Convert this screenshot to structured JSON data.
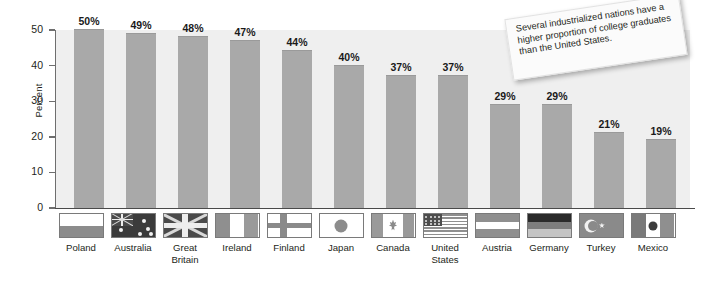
{
  "chart_data": {
    "type": "bar",
    "title": "",
    "xlabel": "",
    "ylabel": "Percent",
    "ylim": [
      0,
      50
    ],
    "yticks": [
      0,
      10,
      20,
      30,
      40,
      50
    ],
    "grid": false,
    "legend": "none",
    "value_suffix": "%",
    "categories": [
      "Poland",
      "Australia",
      "Great Britain",
      "Ireland",
      "Finland",
      "Japan",
      "Canada",
      "United States",
      "Austria",
      "Germany",
      "Turkey",
      "Mexico"
    ],
    "values": [
      50,
      49,
      48,
      47,
      44,
      40,
      37,
      37,
      29,
      29,
      21,
      19
    ],
    "value_labels": [
      "50%",
      "49%",
      "48%",
      "47%",
      "44%",
      "40%",
      "37%",
      "37%",
      "29%",
      "29%",
      "21%",
      "19%"
    ],
    "annotations": [
      "Several industrialized nations have a higher proportion of college graduates than the United States."
    ]
  },
  "axis": {
    "y_title": "Percent",
    "y_tick_labels": [
      "50",
      "40",
      "30",
      "20",
      "10",
      "0"
    ]
  },
  "flags": [
    {
      "country": "Poland",
      "label_lines": [
        "Poland"
      ],
      "icon": "flag-poland"
    },
    {
      "country": "Australia",
      "label_lines": [
        "Australia"
      ],
      "icon": "flag-australia"
    },
    {
      "country": "Great Britain",
      "label_lines": [
        "Great",
        "Britain"
      ],
      "icon": "flag-great-britain"
    },
    {
      "country": "Ireland",
      "label_lines": [
        "Ireland"
      ],
      "icon": "flag-ireland"
    },
    {
      "country": "Finland",
      "label_lines": [
        "Finland"
      ],
      "icon": "flag-finland"
    },
    {
      "country": "Japan",
      "label_lines": [
        "Japan"
      ],
      "icon": "flag-japan"
    },
    {
      "country": "Canada",
      "label_lines": [
        "Canada"
      ],
      "icon": "flag-canada"
    },
    {
      "country": "United States",
      "label_lines": [
        "United",
        "States"
      ],
      "icon": "flag-united-states"
    },
    {
      "country": "Austria",
      "label_lines": [
        "Austria"
      ],
      "icon": "flag-austria"
    },
    {
      "country": "Germany",
      "label_lines": [
        "Germany"
      ],
      "icon": "flag-germany"
    },
    {
      "country": "Turkey",
      "label_lines": [
        "Turkey"
      ],
      "icon": "flag-turkey"
    },
    {
      "country": "Mexico",
      "label_lines": [
        "Mexico"
      ],
      "icon": "flag-mexico"
    }
  ],
  "note": {
    "text": "Several industrialized nations have a higher proportion of college graduates than the United States."
  },
  "colors": {
    "bar": "#a9a9a9",
    "plot_background": "#efefef",
    "axis": "#6e6e6e",
    "text": "#231f20",
    "note_background": "#fbfbfb"
  }
}
